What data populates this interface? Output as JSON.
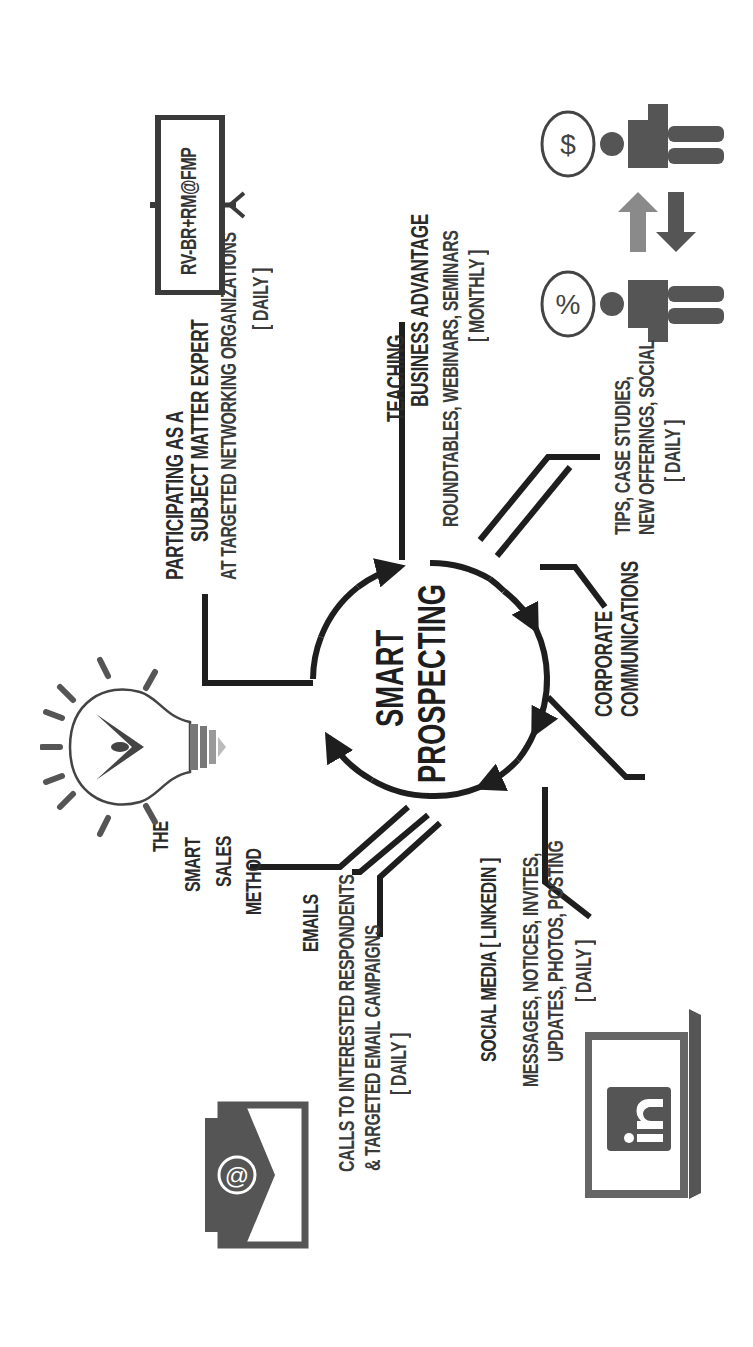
{
  "diagram": {
    "orientation": "rotated-90-ccw",
    "center": {
      "title_line1": "SMART",
      "title_line2": "PROSPECTING"
    },
    "branches": [
      {
        "id": "subject-matter-expert",
        "title_line1": "PARTICIPATING AS A",
        "title_line2": "SUBJECT MATTER EXPERT",
        "detail": "AT TARGETED NETWORKING ORGANIZATIONS",
        "frequency": "[ DAILY ]"
      },
      {
        "id": "teaching",
        "title_line1": "TEACHING",
        "title_line2": "BUSINESS ADVANTAGE",
        "detail": "ROUNDTABLES, WEBINARS, SEMINARS",
        "frequency": "[ MONTHLY ]"
      },
      {
        "id": "corporate-communications",
        "title_line1": "CORPORATE",
        "title_line2": "COMMUNICATIONS",
        "detail_line1": "TIPS, CASE STUDIES,",
        "detail_line2": "NEW OFFERINGS, SOCIAL",
        "frequency": "[ DAILY ]"
      },
      {
        "id": "social-media",
        "title": "SOCIAL MEDIA  [ LINKEDIN ]",
        "detail_line1": "MESSAGES, NOTICES, INVITES,",
        "detail_line2": "UPDATES, PHOTOS, POSTING",
        "frequency": "[ DAILY ]"
      },
      {
        "id": "emails",
        "title": "EMAILS",
        "detail_line1": "CALLS TO INTERESTED RESPONDENTS",
        "detail_line2": "& TARGETED EMAIL CAMPAIGNS",
        "frequency": "[ DAILY ]"
      },
      {
        "id": "smart-sales-method",
        "title_line1": "THE",
        "title_line2": "SMART",
        "title_line3": "SALES",
        "title_line4": "METHOD"
      }
    ],
    "sign": {
      "text": "RV-BR+RM@FMP"
    },
    "icons": {
      "lightbulb": "lightbulb-icon",
      "email": "email-at-icon",
      "linkedin": "linkedin-laptop-icon",
      "exchange": "people-exchange-icon",
      "percent_bubble": "%",
      "dollar_bubble": "$",
      "at_symbol": "@",
      "linkedin_logo": "in"
    },
    "colors": {
      "ink": "#1e1e1e",
      "text": "#2a2a2a",
      "icon_dark": "#555555",
      "arrow_light": "#8a8a8a",
      "background": "#ffffff"
    }
  }
}
